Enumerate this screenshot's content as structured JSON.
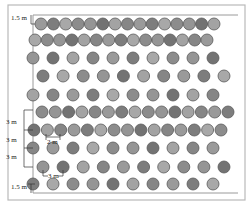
{
  "diagram": {
    "frame": {
      "x": 8,
      "y": 5,
      "w": 237,
      "h": 195
    },
    "top_line": {
      "x1": 33,
      "x2": 238,
      "y": 15
    },
    "bottom_line": {
      "x1": 33,
      "x2": 238,
      "y": 193
    },
    "left_axis": {
      "x": 33,
      "y1": 15,
      "y2": 193
    },
    "circle_radius": 6,
    "rows": [
      {
        "y": 24,
        "x_start": 41,
        "x_end": 214,
        "count": 15,
        "type": "dense"
      },
      {
        "y": 40,
        "x_start": 35,
        "x_end": 207,
        "count": 15,
        "type": "dense"
      },
      {
        "y": 58,
        "x_start": 33,
        "x_end": 213,
        "count": 10,
        "type": "sparse"
      },
      {
        "y": 76,
        "x_start": 43,
        "x_end": 224,
        "count": 10,
        "type": "sparse"
      },
      {
        "y": 95,
        "x_start": 33,
        "x_end": 213,
        "count": 10,
        "type": "sparse"
      },
      {
        "y": 112,
        "x_start": 42,
        "x_end": 228,
        "count": 15,
        "type": "dense"
      },
      {
        "y": 130,
        "x_start": 34,
        "x_end": 221,
        "count": 15,
        "type": "dense"
      },
      {
        "y": 148,
        "x_start": 33,
        "x_end": 213,
        "count": 10,
        "type": "sparse"
      },
      {
        "y": 167,
        "x_start": 43,
        "x_end": 224,
        "count": 10,
        "type": "sparse"
      },
      {
        "y": 184,
        "x_start": 33,
        "x_end": 213,
        "count": 10,
        "type": "sparse"
      }
    ],
    "fill_colors": [
      "#9a9a9a",
      "#8c8c8c",
      "#a3a3a3",
      "#7d7d7d",
      "#959595",
      "#868686",
      "#a8a8a8",
      "#737373"
    ],
    "labels": {
      "top_margin": "1.5 m",
      "row_spacing_1": "3 m",
      "row_spacing_2": "3 m",
      "row_spacing_3": "3 m",
      "plant_spacing_dense": "2 m",
      "plant_spacing_sparse": "3 m",
      "bottom_margin": "1.5 m"
    }
  }
}
